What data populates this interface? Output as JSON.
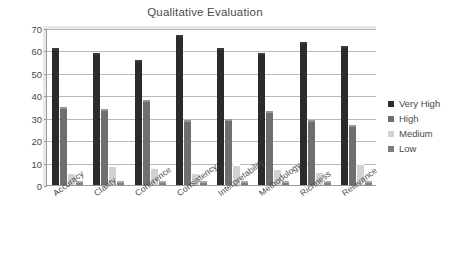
{
  "chart_data": {
    "type": "bar",
    "title": "Qualitative Evaluation",
    "xlabel": "",
    "ylabel": "",
    "ylim": [
      0,
      70
    ],
    "yticks": [
      0,
      10,
      20,
      30,
      40,
      50,
      60,
      70
    ],
    "grid": true,
    "legend_position": "right",
    "categories": [
      "Accuracy",
      "Clarity",
      "Coherence",
      "Consistency",
      "Interpretability",
      "Methodology",
      "Richness",
      "Relevance"
    ],
    "series": [
      {
        "name": "Very High",
        "color": "#2b2b2b",
        "values": [
          60,
          58,
          55,
          66,
          60,
          58,
          63,
          61
        ]
      },
      {
        "name": "High",
        "color": "#6f6f6f",
        "values": [
          34,
          33,
          37,
          28,
          28.5,
          32,
          28,
          26
        ]
      },
      {
        "name": "Medium",
        "color": "#d2d2d2",
        "values": [
          5,
          8,
          7,
          5,
          8.5,
          6.5,
          5.5,
          9
        ]
      },
      {
        "name": "Low",
        "color": "#7d7d7d",
        "values": [
          1,
          0.7,
          0.8,
          0.9,
          0.8,
          0.7,
          0.8,
          0.9
        ]
      }
    ]
  },
  "legend": {
    "items": [
      {
        "label": "Very High",
        "color": "#2b2b2b"
      },
      {
        "label": "High",
        "color": "#6f6f6f"
      },
      {
        "label": "Medium",
        "color": "#d2d2d2"
      },
      {
        "label": "Low",
        "color": "#7d7d7d"
      }
    ]
  }
}
